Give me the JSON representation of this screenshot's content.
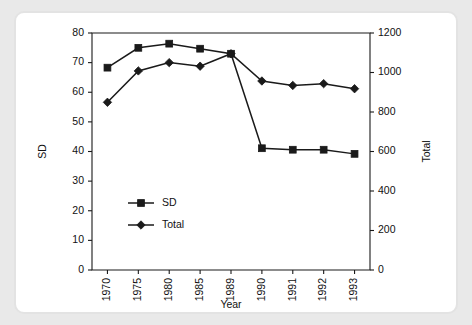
{
  "chart_data": {
    "type": "line",
    "title": "",
    "xlabel": "Year",
    "ylabel": "SD",
    "y2label": "Total",
    "categories": [
      "1970",
      "1975",
      "1980",
      "1985",
      "1989",
      "1990",
      "1991",
      "1992",
      "1993"
    ],
    "ylim": [
      0,
      80
    ],
    "yticks": [
      0,
      10,
      20,
      30,
      40,
      50,
      60,
      70,
      80
    ],
    "y2lim": [
      0,
      1200
    ],
    "y2ticks": [
      0,
      200,
      400,
      600,
      800,
      1000,
      1200
    ],
    "grid": false,
    "legend_position": "inside-lower-left",
    "series": [
      {
        "name": "SD",
        "axis": "left",
        "marker": "square",
        "values": [
          68.3,
          75.0,
          76.4,
          74.7,
          73.0,
          41.1,
          40.6,
          40.6,
          39.2
        ]
      },
      {
        "name": "Total",
        "axis": "right",
        "marker": "diamond",
        "values": [
          849,
          1008,
          1050,
          1032,
          1095,
          957,
          935,
          943,
          918
        ],
        "values_on_left_scale": [
          56.6,
          67.2,
          70.0,
          68.8,
          73.0,
          63.8,
          62.3,
          62.9,
          61.2
        ]
      }
    ],
    "legend": [
      {
        "label": "SD",
        "marker": "square"
      },
      {
        "label": "Total",
        "marker": "diamond"
      }
    ],
    "colors": {
      "series": "#1a1a1a",
      "axis": "#1a1a1a",
      "background": "#ffffff",
      "page_background": "#e9e9e9",
      "card_border": "#e3e3e3"
    }
  }
}
